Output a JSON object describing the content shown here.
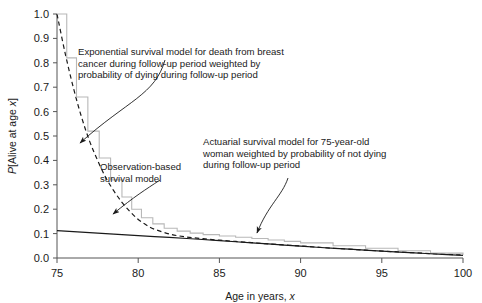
{
  "chart_data": {
    "type": "line",
    "title": "",
    "xlabel": "Age in years, x",
    "ylabel": "P[Alive at age x]",
    "xlim": [
      75,
      100
    ],
    "ylim": [
      0.0,
      1.0
    ],
    "xticks": [
      "75",
      "80",
      "85",
      "90",
      "95",
      "100"
    ],
    "yticks": [
      "0.0",
      "0.1",
      "0.2",
      "0.3",
      "0.4",
      "0.5",
      "0.6",
      "0.7",
      "0.8",
      "0.9",
      "1.0"
    ],
    "grid": false,
    "legend_position": "none",
    "series": [
      {
        "name": "Exponential survival model for death from breast cancer during follow-up period weighted by probability of dying during follow-up period",
        "style": "dashed",
        "color": "#1a1a1a",
        "x": [
          75,
          75.5,
          76,
          76.5,
          77,
          77.5,
          78,
          78.5,
          79,
          79.5,
          80,
          80.5,
          81,
          82,
          83,
          84,
          85,
          86,
          87,
          88,
          90,
          92,
          94,
          96,
          98,
          100
        ],
        "y": [
          1.0,
          0.84,
          0.7,
          0.58,
          0.48,
          0.4,
          0.33,
          0.275,
          0.228,
          0.19,
          0.158,
          0.135,
          0.118,
          0.097,
          0.086,
          0.079,
          0.073,
          0.068,
          0.063,
          0.058,
          0.049,
          0.04,
          0.032,
          0.025,
          0.018,
          0.012
        ]
      },
      {
        "name": "Observation-based survival model",
        "style": "stepped-solid",
        "color": "#b8b8b8",
        "x": [
          75,
          75.6,
          76.2,
          76.9,
          77.6,
          78.3,
          79,
          79.6,
          80.2,
          80.9,
          81.6,
          82.4,
          83.2,
          84,
          85,
          86,
          87,
          88,
          89,
          90,
          92,
          94,
          96,
          98,
          100
        ],
        "y": [
          1.0,
          0.82,
          0.66,
          0.52,
          0.41,
          0.32,
          0.25,
          0.2,
          0.165,
          0.14,
          0.122,
          0.11,
          0.102,
          0.096,
          0.09,
          0.085,
          0.08,
          0.074,
          0.068,
          0.062,
          0.05,
          0.04,
          0.03,
          0.02,
          0.012
        ]
      },
      {
        "name": "Actuarial survival model for 75-year-old woman weighted by probability of not dying during follow-up period",
        "style": "solid",
        "color": "#1a1a1a",
        "x": [
          75,
          77,
          79,
          81,
          83,
          85,
          87,
          89,
          91,
          93,
          95,
          97,
          99,
          100
        ],
        "y": [
          0.112,
          0.104,
          0.096,
          0.088,
          0.08,
          0.071,
          0.062,
          0.053,
          0.044,
          0.036,
          0.028,
          0.021,
          0.014,
          0.011
        ]
      }
    ],
    "annotations": [
      {
        "id": "exponential-note",
        "lines": [
          "Exponential survival model for death from breast",
          "cancer during follow-up period weighted by",
          "probability of dying during follow-up period"
        ]
      },
      {
        "id": "observation-note",
        "lines": [
          "Observation-based",
          "survival model"
        ]
      },
      {
        "id": "actuarial-note",
        "lines": [
          "Actuarial survival model for 75-year-old",
          "woman weighted by probability of not dying",
          "during follow-up period"
        ]
      }
    ]
  },
  "axes": {
    "x_label_prefix": "Age in years, ",
    "x_label_italic": "x",
    "y_label_prefix": "P",
    "y_label_mid": "[Alive at age ",
    "y_label_italic": "x",
    "y_label_suffix": "]"
  },
  "colors": {
    "axis": "#555555",
    "ink": "#1a1a1a",
    "observation": "#b8b8b8"
  }
}
